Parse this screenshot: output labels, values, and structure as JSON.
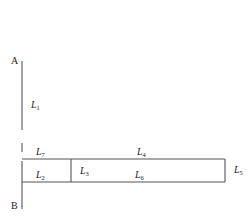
{
  "diagram": {
    "points": {
      "A": {
        "label": "A"
      },
      "B": {
        "label": "B"
      }
    },
    "segments": [
      {
        "id": "L1",
        "base": "L",
        "sub": "1"
      },
      {
        "id": "L2",
        "base": "L",
        "sub": "2"
      },
      {
        "id": "L3",
        "base": "L",
        "sub": "3"
      },
      {
        "id": "L4",
        "base": "L",
        "sub": "4"
      },
      {
        "id": "L5",
        "base": "L",
        "sub": "5"
      },
      {
        "id": "L6",
        "base": "L",
        "sub": "6"
      },
      {
        "id": "L7",
        "base": "L",
        "sub": "7"
      }
    ]
  }
}
